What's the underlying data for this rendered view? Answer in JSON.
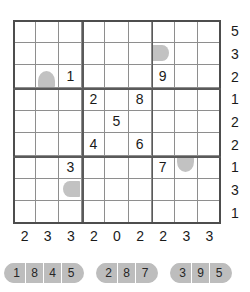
{
  "grid": {
    "rows": 9,
    "cols": 9,
    "cells": [
      [
        {
          "value": "",
          "blob": ""
        },
        {
          "value": "",
          "blob": ""
        },
        {
          "value": "",
          "blob": ""
        },
        {
          "value": "",
          "blob": ""
        },
        {
          "value": "",
          "blob": ""
        },
        {
          "value": "",
          "blob": ""
        },
        {
          "value": "",
          "blob": ""
        },
        {
          "value": "",
          "blob": ""
        },
        {
          "value": "",
          "blob": ""
        }
      ],
      [
        {
          "value": "",
          "blob": ""
        },
        {
          "value": "",
          "blob": ""
        },
        {
          "value": "",
          "blob": ""
        },
        {
          "value": "",
          "blob": ""
        },
        {
          "value": "",
          "blob": ""
        },
        {
          "value": "",
          "blob": ""
        },
        {
          "value": "",
          "blob": "dome-right"
        },
        {
          "value": "",
          "blob": ""
        },
        {
          "value": "",
          "blob": ""
        }
      ],
      [
        {
          "value": "",
          "blob": ""
        },
        {
          "value": "",
          "blob": "dome-up"
        },
        {
          "value": "1",
          "blob": ""
        },
        {
          "value": "",
          "blob": ""
        },
        {
          "value": "",
          "blob": ""
        },
        {
          "value": "",
          "blob": ""
        },
        {
          "value": "9",
          "blob": ""
        },
        {
          "value": "",
          "blob": ""
        },
        {
          "value": "",
          "blob": ""
        }
      ],
      [
        {
          "value": "",
          "blob": ""
        },
        {
          "value": "",
          "blob": ""
        },
        {
          "value": "",
          "blob": ""
        },
        {
          "value": "2",
          "blob": ""
        },
        {
          "value": "",
          "blob": ""
        },
        {
          "value": "8",
          "blob": ""
        },
        {
          "value": "",
          "blob": ""
        },
        {
          "value": "",
          "blob": ""
        },
        {
          "value": "",
          "blob": ""
        }
      ],
      [
        {
          "value": "",
          "blob": ""
        },
        {
          "value": "",
          "blob": ""
        },
        {
          "value": "",
          "blob": ""
        },
        {
          "value": "",
          "blob": ""
        },
        {
          "value": "5",
          "blob": ""
        },
        {
          "value": "",
          "blob": ""
        },
        {
          "value": "",
          "blob": ""
        },
        {
          "value": "",
          "blob": ""
        },
        {
          "value": "",
          "blob": ""
        }
      ],
      [
        {
          "value": "",
          "blob": ""
        },
        {
          "value": "",
          "blob": ""
        },
        {
          "value": "",
          "blob": ""
        },
        {
          "value": "4",
          "blob": ""
        },
        {
          "value": "",
          "blob": ""
        },
        {
          "value": "6",
          "blob": ""
        },
        {
          "value": "",
          "blob": ""
        },
        {
          "value": "",
          "blob": ""
        },
        {
          "value": "",
          "blob": ""
        }
      ],
      [
        {
          "value": "",
          "blob": ""
        },
        {
          "value": "",
          "blob": ""
        },
        {
          "value": "3",
          "blob": ""
        },
        {
          "value": "",
          "blob": ""
        },
        {
          "value": "",
          "blob": ""
        },
        {
          "value": "",
          "blob": ""
        },
        {
          "value": "7",
          "blob": ""
        },
        {
          "value": "",
          "blob": "dome-down"
        },
        {
          "value": "",
          "blob": ""
        }
      ],
      [
        {
          "value": "",
          "blob": ""
        },
        {
          "value": "",
          "blob": ""
        },
        {
          "value": "",
          "blob": "dome-left"
        },
        {
          "value": "",
          "blob": ""
        },
        {
          "value": "",
          "blob": ""
        },
        {
          "value": "",
          "blob": ""
        },
        {
          "value": "",
          "blob": ""
        },
        {
          "value": "",
          "blob": ""
        },
        {
          "value": "",
          "blob": ""
        }
      ],
      [
        {
          "value": "",
          "blob": ""
        },
        {
          "value": "",
          "blob": ""
        },
        {
          "value": "",
          "blob": ""
        },
        {
          "value": "",
          "blob": ""
        },
        {
          "value": "",
          "blob": ""
        },
        {
          "value": "",
          "blob": ""
        },
        {
          "value": "",
          "blob": ""
        },
        {
          "value": "",
          "blob": ""
        },
        {
          "value": "",
          "blob": ""
        }
      ]
    ]
  },
  "clues": {
    "right": [
      "5",
      "3",
      "2",
      "1",
      "2",
      "2",
      "1",
      "3",
      "1"
    ],
    "bottom": [
      "2",
      "3",
      "3",
      "2",
      "0",
      "2",
      "2",
      "3",
      "3"
    ]
  },
  "legend": {
    "groups": [
      {
        "digits": [
          "1",
          "8",
          "4",
          "5"
        ]
      },
      {
        "digits": [
          "2",
          "8",
          "7"
        ]
      },
      {
        "digits": [
          "3",
          "9",
          "5"
        ]
      }
    ]
  },
  "colors": {
    "blob_fill": "#c2c2c2",
    "grid_line": "#8e8e8e",
    "box_line": "#5a5a5a",
    "pill_fill": "#bdbdbd",
    "text": "#1a1a1a"
  }
}
